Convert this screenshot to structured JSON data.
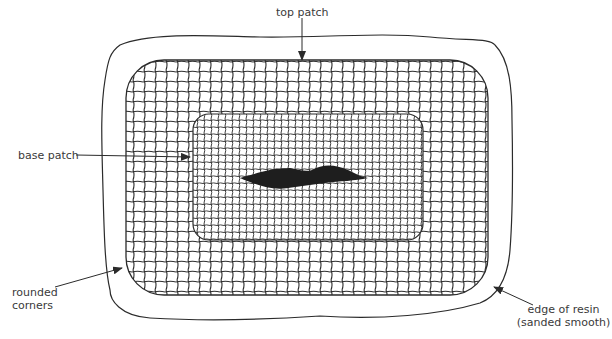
{
  "figure": {
    "labels": {
      "top_patch": "top patch",
      "base_patch": "base patch",
      "rounded_corners_line1": "rounded",
      "rounded_corners_line2": "corners",
      "edge_of_resin_line1": "edge of resin",
      "edge_of_resin_line2": "(sanded smooth)"
    },
    "caption": "",
    "colors": {
      "line": "#2b2b2b",
      "damage_fill": "#1e1e1e",
      "background": "#ffffff",
      "label_text": "#3a3a3a"
    },
    "components": [
      {
        "name": "resin-edge-outline",
        "description": "irregular outer boundary of resin"
      },
      {
        "name": "top-patch",
        "description": "large rounded rectangle of woven cloth"
      },
      {
        "name": "base-patch",
        "description": "smaller rounded rectangle of finer woven cloth"
      },
      {
        "name": "damage-hole",
        "description": "dark elongated damaged area in center"
      }
    ]
  }
}
